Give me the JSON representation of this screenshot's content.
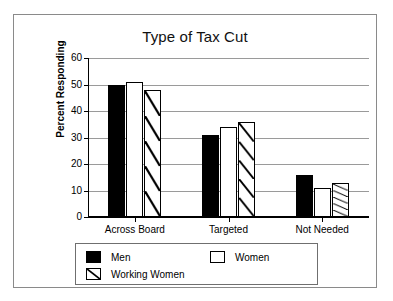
{
  "chart_data": {
    "type": "bar",
    "title": "Type of Tax Cut",
    "xlabel": "",
    "ylabel": "Percent Responding",
    "categories": [
      "Across Board",
      "Targeted",
      "Not Needed"
    ],
    "series": [
      {
        "name": "Men",
        "pattern": "solid-black",
        "values": [
          50,
          31,
          16
        ]
      },
      {
        "name": "Women",
        "pattern": "white",
        "values": [
          51,
          34,
          11
        ]
      },
      {
        "name": "Working Women",
        "pattern": "diagonal-hatch",
        "values": [
          48,
          36,
          13
        ]
      }
    ],
    "ylim": [
      0,
      60
    ],
    "yticks": [
      0,
      10,
      20,
      30,
      40,
      50,
      60
    ],
    "ytick_labels": [
      "0",
      "10",
      "20",
      "30",
      "40",
      "50",
      "60"
    ],
    "grid": true,
    "grid_axis": "y",
    "legend_position": "bottom",
    "colors": {
      "bar_outline": "#000000",
      "men_fill": "#000000",
      "women_fill": "#ffffff",
      "working_women_fill": "#ffffff",
      "gridline": "#9a9a9a",
      "axis": "#000000",
      "frame": "#8a8a8a",
      "legend_border": "#6f6f6f",
      "background": "#ffffff"
    }
  },
  "legend": {
    "entries": [
      {
        "label": "Men"
      },
      {
        "label": "Women"
      },
      {
        "label": "Working Women"
      }
    ]
  }
}
